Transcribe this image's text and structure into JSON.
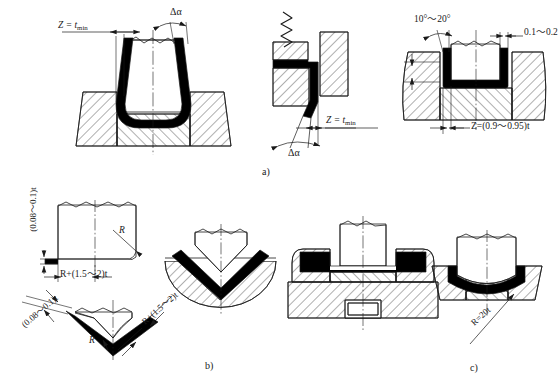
{
  "figure": {
    "type": "technical-engineering-drawing",
    "background_color": "#ffffff",
    "line_color": "#1a1a1a",
    "blank_fill_color": "#000000"
  },
  "captions": {
    "a": "a)",
    "b": "b)",
    "c": "c)"
  },
  "panel_a": {
    "name": "Springback compensation in U-bending and wipe bending",
    "left_view": {
      "name": "U-bend punch and die with clearance",
      "labels": {
        "clearance": "Z = t",
        "clearance_sub": "min",
        "angle": "Δα"
      }
    },
    "middle_view": {
      "name": "Wipe bending with spring loaded pressure pad",
      "labels": {
        "clearance": "Z = t",
        "clearance_sub": "min",
        "angle": "Δα"
      }
    },
    "right_view": {
      "name": "U-bend die with relieved corners and negative clearance",
      "labels": {
        "draft_angle": "10°～20°",
        "corner_relief": "0.1～0.2",
        "land_height": "(1-1.5)t",
        "clearance": "Z=(0.9～0.95)t"
      }
    }
  },
  "panel_b": {
    "name": "V-bending punch profile with localized ridge and matching die",
    "punch_detail": {
      "labels": {
        "ridge_height": "(0.08～0.1)t",
        "ridge_offset": "R+(1.5～2)t",
        "punch_radius": "R"
      }
    },
    "v_punch_detail": {
      "labels": {
        "ridge_height": "(0.08～0.1)t",
        "ridge_offset": "R+(1.5～2)t",
        "punch_radius": "R"
      }
    },
    "v_die_view": {
      "name": "V-die with bent blank seated in the vee"
    }
  },
  "panel_c": {
    "name": "Bottoming dies producing reverse curvature in the blank",
    "flat_bottom_view": {
      "name": "U-die with flat bottom coining pad"
    },
    "curved_bottom_view": {
      "name": "U-die with convex bottom profile",
      "labels": {
        "bottom_radius": "R=20t"
      }
    }
  }
}
